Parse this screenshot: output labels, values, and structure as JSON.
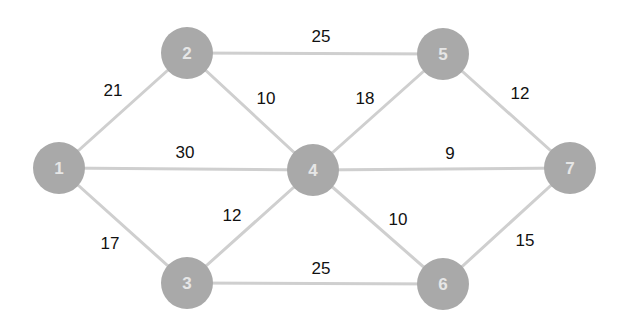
{
  "diagram": {
    "type": "weighted-undirected-graph",
    "colors": {
      "background": "#ffffff",
      "node_fill": "#a9a9a9",
      "node_label": "#e6e6e6",
      "edge": "#cfcfcf",
      "weight_text": "#111111"
    },
    "node_radius": 26,
    "nodes": [
      {
        "id": "1",
        "label": "1",
        "x": 59,
        "y": 168
      },
      {
        "id": "2",
        "label": "2",
        "x": 187,
        "y": 53
      },
      {
        "id": "3",
        "label": "3",
        "x": 187,
        "y": 283
      },
      {
        "id": "4",
        "label": "4",
        "x": 313,
        "y": 170
      },
      {
        "id": "5",
        "label": "5",
        "x": 443,
        "y": 54
      },
      {
        "id": "6",
        "label": "6",
        "x": 443,
        "y": 284
      },
      {
        "id": "7",
        "label": "7",
        "x": 570,
        "y": 168
      }
    ],
    "edges": [
      {
        "from": "1",
        "to": "2",
        "weight": "21",
        "label_x": 113,
        "label_y": 90
      },
      {
        "from": "1",
        "to": "4",
        "weight": "30",
        "label_x": 185,
        "label_y": 152
      },
      {
        "from": "1",
        "to": "3",
        "weight": "17",
        "label_x": 110,
        "label_y": 243
      },
      {
        "from": "2",
        "to": "5",
        "weight": "25",
        "label_x": 321,
        "label_y": 36
      },
      {
        "from": "2",
        "to": "4",
        "weight": "10",
        "label_x": 266,
        "label_y": 98
      },
      {
        "from": "3",
        "to": "4",
        "weight": "12",
        "label_x": 232,
        "label_y": 215
      },
      {
        "from": "3",
        "to": "6",
        "weight": "25",
        "label_x": 321,
        "label_y": 268
      },
      {
        "from": "4",
        "to": "5",
        "weight": "18",
        "label_x": 365,
        "label_y": 98
      },
      {
        "from": "4",
        "to": "7",
        "weight": "9",
        "label_x": 450,
        "label_y": 153
      },
      {
        "from": "4",
        "to": "6",
        "weight": "10",
        "label_x": 398,
        "label_y": 219
      },
      {
        "from": "5",
        "to": "7",
        "weight": "12",
        "label_x": 520,
        "label_y": 93
      },
      {
        "from": "6",
        "to": "7",
        "weight": "15",
        "label_x": 525,
        "label_y": 240
      }
    ]
  }
}
